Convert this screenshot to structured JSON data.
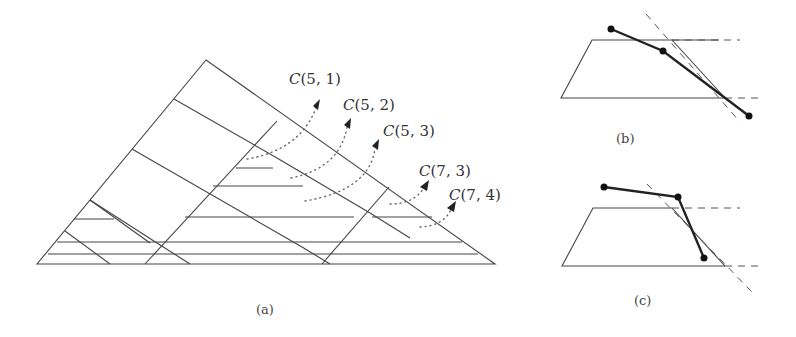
{
  "figure": {
    "panel_a": {
      "caption": "(a)",
      "labels": [
        {
          "id": "c51",
          "name": "C",
          "args": "(5, 1)"
        },
        {
          "id": "c52",
          "name": "C",
          "args": "(5, 2)"
        },
        {
          "id": "c53",
          "name": "C",
          "args": "(5, 3)"
        },
        {
          "id": "c73",
          "name": "C",
          "args": "(7, 3)"
        },
        {
          "id": "c74",
          "name": "C",
          "args": "(7, 4)"
        }
      ]
    },
    "panel_b": {
      "caption": "(b)"
    },
    "panel_c": {
      "caption": "(c)"
    }
  },
  "colors": {
    "line": "#444444",
    "polyline": "#222222",
    "background": "#ffffff"
  }
}
